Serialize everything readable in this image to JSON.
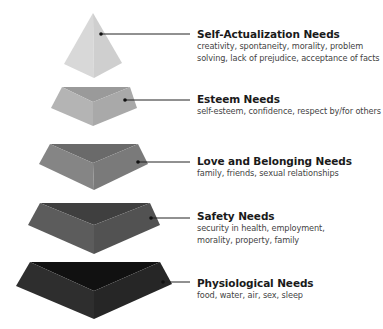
{
  "diagram": {
    "type": "pyramid-hierarchy",
    "tiers": [
      {
        "id": "self-actualization",
        "title": "Self-Actualization Needs",
        "desc_lines": [
          "creativity, spontaneity, morality, problem",
          "solving, lack of prejudice, acceptance of facts"
        ],
        "color_top": "#e2e2e2",
        "color_left": "#d8d8d8",
        "color_right": "#cfcfcf",
        "label_top": 28
      },
      {
        "id": "esteem",
        "title": "Esteem Needs",
        "desc_lines": [
          "self-esteem, confidence, respect by/for others"
        ],
        "color_top": "#9a9a9a",
        "color_left": "#b4b4b4",
        "color_right": "#a9a9a9",
        "label_top": 93
      },
      {
        "id": "love-belonging",
        "title": "Love and Belonging Needs",
        "desc_lines": [
          "family, friends, sexual relationships"
        ],
        "color_top": "#6a6a6a",
        "color_left": "#858585",
        "color_right": "#7a7a7a",
        "label_top": 155
      },
      {
        "id": "safety",
        "title": "Safety Needs",
        "desc_lines": [
          "security in health, employment,",
          "morality, property, family"
        ],
        "color_top": "#3f3f3f",
        "color_left": "#5c5c5c",
        "color_right": "#525252",
        "label_top": 210
      },
      {
        "id": "physiological",
        "title": "Physiological Needs",
        "desc_lines": [
          "food, water, air, sex, sleep"
        ],
        "color_top": "#111111",
        "color_left": "#2e2e2e",
        "color_right": "#262626",
        "label_top": 277
      }
    ],
    "connector_color": "#222222"
  }
}
